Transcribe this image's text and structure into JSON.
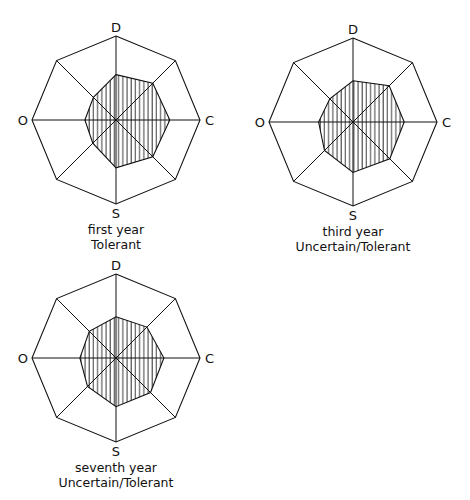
{
  "figure": {
    "axes": [
      "D",
      "C",
      "S",
      "O"
    ],
    "spokes": 8,
    "colors": {
      "line": "#111111",
      "hatch": "#222222",
      "background": "#ffffff"
    }
  },
  "chart_data": [
    {
      "type": "radar",
      "title": "first year",
      "subtitle": "Tolerant",
      "axis_labels": {
        "top": "D",
        "right": "C",
        "bottom": "S",
        "left": "O"
      },
      "directions": [
        "D",
        "NE",
        "C",
        "SE",
        "S",
        "SW",
        "O",
        "NW"
      ],
      "values": [
        0.54,
        0.62,
        0.64,
        0.62,
        0.57,
        0.39,
        0.37,
        0.38
      ],
      "range": [
        0,
        1
      ],
      "center": [
        116,
        120
      ],
      "radius": 84
    },
    {
      "type": "radar",
      "title": "third year",
      "subtitle": "Uncertain/Tolerant",
      "axis_labels": {
        "top": "D",
        "right": "C",
        "bottom": "S",
        "left": "O"
      },
      "directions": [
        "D",
        "NE",
        "C",
        "SE",
        "S",
        "SW",
        "O",
        "NW"
      ],
      "values": [
        0.49,
        0.61,
        0.61,
        0.62,
        0.6,
        0.48,
        0.41,
        0.39
      ],
      "range": [
        0,
        1
      ],
      "center": [
        353,
        122
      ],
      "radius": 84
    },
    {
      "type": "radar",
      "title": "seventh year",
      "subtitle": "Uncertain/Tolerant",
      "axis_labels": {
        "top": "D",
        "right": "C",
        "bottom": "S",
        "left": "O"
      },
      "directions": [
        "D",
        "NE",
        "C",
        "SE",
        "S",
        "SW",
        "O",
        "NW"
      ],
      "values": [
        0.49,
        0.52,
        0.57,
        0.58,
        0.58,
        0.48,
        0.43,
        0.45
      ],
      "range": [
        0,
        1
      ],
      "center": [
        116,
        358
      ],
      "radius": 84
    }
  ]
}
